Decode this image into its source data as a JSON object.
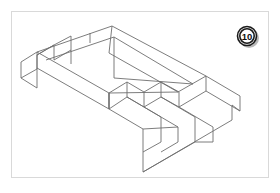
{
  "sheet": {
    "title": "Isometric pictorial of L-shaped stepped block",
    "background_color": "#ffffff",
    "frame_color": "#d9d9d9"
  },
  "badge": {
    "name": "problem-number-badge",
    "label": "10",
    "shape": "circle",
    "fill_color": "#ffffff",
    "stroke_color": "#1b1b1b",
    "text_color": "#111111",
    "center_x": 247,
    "center_y": 36,
    "radius": 10
  },
  "drawing": {
    "name": "isometric-part-drawing",
    "projection": "isometric",
    "line_color": "#6e6e6e",
    "face_color": "#ffffff",
    "line_width": 0.9,
    "description": "L-shaped base plate; left arm ends in a stepped notch, right arm carries three parallel steps rising toward the back",
    "features": [
      {
        "name": "top-face-L",
        "kind": "polygon",
        "points": "112,26 206,76 178,92 160,82 143,91 126,82 108,92 36,51 55,41 70,50 86,41 99,50"
      },
      {
        "name": "left-arm-front-face",
        "kind": "polygon",
        "points": "36,51 108,92 108,107 36,66"
      },
      {
        "name": "left-arm-end-face",
        "kind": "polygon",
        "points": "19,61 36,51 36,66 19,76"
      },
      {
        "name": "left-notch-step-upper",
        "kind": "polyline",
        "points": "55,41 55,56 70,65 70,50"
      },
      {
        "name": "left-notch-step-lower",
        "kind": "polyline",
        "points": "86,41 86,56 99,64 99,50"
      },
      {
        "name": "left-notch-floor",
        "kind": "polyline",
        "points": "19,61 36,51"
      },
      {
        "name": "right-riser-1",
        "kind": "polyline",
        "points": "206,76 206,90 178,106 178,92"
      },
      {
        "name": "right-riser-2",
        "kind": "polyline",
        "points": "178,92 160,82 160,96 178,106"
      },
      {
        "name": "right-riser-3",
        "kind": "polyline",
        "points": "160,82 143,91 143,106 160,96"
      },
      {
        "name": "right-step-run-1",
        "kind": "polyline",
        "points": "143,91 126,82 126,96 143,106"
      },
      {
        "name": "right-step-run-2",
        "kind": "polyline",
        "points": "126,82 108,92 108,107 126,96"
      },
      {
        "name": "right-arm-front-left-face",
        "kind": "polygon",
        "points": "108,92 108,107 143,128 143,113"
      },
      {
        "name": "right-arm-bottom-edge",
        "kind": "polyline",
        "points": "108,107 143,128 143,170 232,118 232,104"
      }
    ]
  }
}
